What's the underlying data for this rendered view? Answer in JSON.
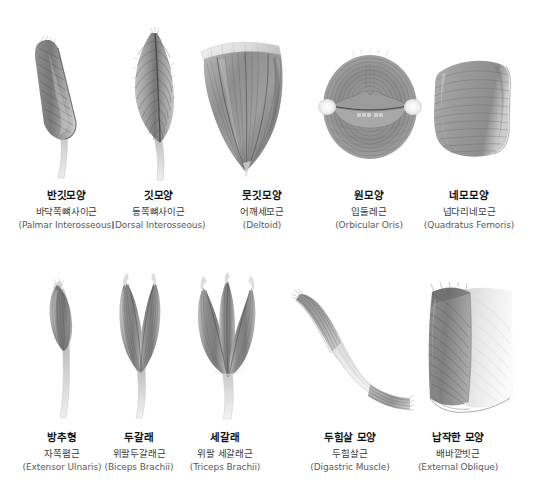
{
  "figure": {
    "title_visible": false,
    "background_color": "#ffffff",
    "muscle_fill_dark": "#6e6e6e",
    "muscle_fill_mid": "#9a9a9a",
    "muscle_fill_light": "#c9c9c9",
    "tendon_color": "#e3e3e3",
    "fiber_line_color": "#5c5c5c"
  },
  "rows": [
    {
      "row_index": 0,
      "items": [
        {
          "icon": "unipennate-muscle-icon",
          "shape_ko": "반깃모양",
          "name_ko": "바닥쪽뼈사이근",
          "name_la": "(Palmar Interosseous)"
        },
        {
          "icon": "bipennate-muscle-icon",
          "shape_ko": "깃모양",
          "name_ko": "등쪽뼈사이근",
          "name_la": "(Dorsal Interosseous)"
        },
        {
          "icon": "multipennate-muscle-icon",
          "shape_ko": "뭇깃모양",
          "name_ko": "어깨세모근",
          "name_la": "(Deltoid)"
        },
        {
          "icon": "circular-muscle-icon",
          "shape_ko": "원모양",
          "name_ko": "입둘레근",
          "name_la": "(Orbicular Oris)"
        },
        {
          "icon": "quadrate-muscle-icon",
          "shape_ko": "네모모양",
          "name_ko": "넙다리네모근",
          "name_la": "(Quadratus Femoris)"
        }
      ]
    },
    {
      "row_index": 1,
      "items": [
        {
          "icon": "fusiform-muscle-icon",
          "shape_ko": "방추형",
          "name_ko": "자쪽폄근",
          "name_la": "(Extensor Ulnaris)"
        },
        {
          "icon": "biceps-muscle-icon",
          "shape_ko": "두갈래",
          "name_ko": "위팔두갈래근",
          "name_la": "(Biceps Brachii)"
        },
        {
          "icon": "triceps-muscle-icon",
          "shape_ko": "세갈래",
          "name_ko": "위팔 세갈래근",
          "name_la": "(Triceps Brachii)"
        },
        {
          "icon": "digastric-muscle-icon",
          "shape_ko": "두힘살 모양",
          "name_ko": "두힘살근",
          "name_la": "(Digastric Muscle)"
        },
        {
          "icon": "flat-muscle-icon",
          "shape_ko": "납작한 모양",
          "name_ko": "배바깥빗근",
          "name_la": "(External Oblique)"
        }
      ]
    }
  ]
}
